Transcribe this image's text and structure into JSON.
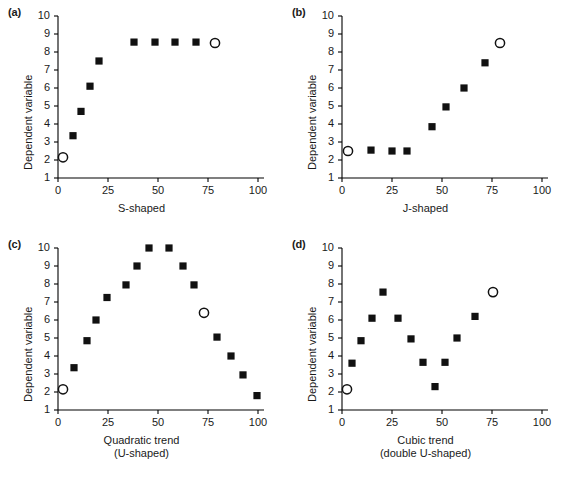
{
  "figure": {
    "caption_partial": "",
    "marker_filled": "filled-square",
    "marker_open": "open-circle",
    "axis_color": "#000000",
    "marker_color": "#111111"
  },
  "common": {
    "ylabel": "Dependent variable",
    "y_ticks": [
      "1",
      "2",
      "3",
      "4",
      "5",
      "6",
      "7",
      "8",
      "9",
      "10"
    ],
    "x_ticks": [
      "0",
      "25",
      "50",
      "75",
      "100"
    ],
    "ylim": [
      1,
      10
    ],
    "xlim": [
      0,
      100
    ]
  },
  "chart_data": [
    {
      "type": "scatter",
      "panel": "(a)",
      "title": "",
      "xlabel": "S-shaped",
      "xlabel_line2": "",
      "ylabel": "Dependent variable",
      "xlim": [
        0,
        100
      ],
      "ylim": [
        1,
        10
      ],
      "grid": false,
      "legend": "none",
      "series": [
        {
          "name": "data",
          "marker": "filled-square",
          "points": [
            {
              "x": 7.5,
              "y": 3.35
            },
            {
              "x": 11.5,
              "y": 4.7
            },
            {
              "x": 16.0,
              "y": 6.1
            },
            {
              "x": 20.5,
              "y": 7.5
            },
            {
              "x": 38.0,
              "y": 8.55
            },
            {
              "x": 48.5,
              "y": 8.55
            },
            {
              "x": 58.5,
              "y": 8.55
            },
            {
              "x": 69.0,
              "y": 8.55
            }
          ]
        },
        {
          "name": "highlighted",
          "marker": "open-circle",
          "points": [
            {
              "x": 2.5,
              "y": 2.15
            },
            {
              "x": 78.5,
              "y": 8.5
            }
          ]
        }
      ]
    },
    {
      "type": "scatter",
      "panel": "(b)",
      "title": "",
      "xlabel": "J-shaped",
      "xlabel_line2": "",
      "ylabel": "Dependent variable",
      "xlim": [
        0,
        100
      ],
      "ylim": [
        1,
        10
      ],
      "grid": false,
      "legend": "none",
      "series": [
        {
          "name": "data",
          "marker": "filled-square",
          "points": [
            {
              "x": 14.5,
              "y": 2.55
            },
            {
              "x": 25.0,
              "y": 2.5
            },
            {
              "x": 32.5,
              "y": 2.5
            },
            {
              "x": 45.0,
              "y": 3.85
            },
            {
              "x": 52.0,
              "y": 4.95
            },
            {
              "x": 61.0,
              "y": 6.0
            },
            {
              "x": 71.5,
              "y": 7.4
            }
          ]
        },
        {
          "name": "highlighted",
          "marker": "open-circle",
          "points": [
            {
              "x": 3.0,
              "y": 2.5
            },
            {
              "x": 79.0,
              "y": 8.5
            }
          ]
        }
      ]
    },
    {
      "type": "scatter",
      "panel": "(c)",
      "title": "",
      "xlabel": "Quadratic trend",
      "xlabel_line2": "(U-shaped)",
      "ylabel": "Dependent variable",
      "xlim": [
        0,
        100
      ],
      "ylim": [
        1,
        10
      ],
      "grid": false,
      "legend": "none",
      "series": [
        {
          "name": "data",
          "marker": "filled-square",
          "points": [
            {
              "x": 8.0,
              "y": 3.35
            },
            {
              "x": 14.5,
              "y": 4.85
            },
            {
              "x": 19.0,
              "y": 6.0
            },
            {
              "x": 24.5,
              "y": 7.25
            },
            {
              "x": 34.0,
              "y": 7.95
            },
            {
              "x": 39.5,
              "y": 9.0
            },
            {
              "x": 45.5,
              "y": 10.0
            },
            {
              "x": 55.5,
              "y": 10.0
            },
            {
              "x": 62.5,
              "y": 9.0
            },
            {
              "x": 68.0,
              "y": 7.95
            },
            {
              "x": 79.5,
              "y": 5.05
            },
            {
              "x": 86.5,
              "y": 4.0
            },
            {
              "x": 92.5,
              "y": 2.95
            },
            {
              "x": 99.5,
              "y": 1.8
            }
          ]
        },
        {
          "name": "highlighted",
          "marker": "open-circle",
          "points": [
            {
              "x": 2.5,
              "y": 2.15
            },
            {
              "x": 73.0,
              "y": 6.4
            }
          ]
        }
      ]
    },
    {
      "type": "scatter",
      "panel": "(d)",
      "title": "",
      "xlabel": "Cubic trend",
      "xlabel_line2": "(double U-shaped)",
      "ylabel": "Dependent variable",
      "xlim": [
        0,
        100
      ],
      "ylim": [
        1,
        10
      ],
      "grid": false,
      "legend": "none",
      "series": [
        {
          "name": "data",
          "marker": "filled-square",
          "points": [
            {
              "x": 5.0,
              "y": 3.6
            },
            {
              "x": 9.5,
              "y": 4.85
            },
            {
              "x": 15.0,
              "y": 6.1
            },
            {
              "x": 20.5,
              "y": 7.55
            },
            {
              "x": 28.0,
              "y": 6.1
            },
            {
              "x": 34.5,
              "y": 4.95
            },
            {
              "x": 40.5,
              "y": 3.65
            },
            {
              "x": 46.5,
              "y": 2.3
            },
            {
              "x": 51.5,
              "y": 3.65
            },
            {
              "x": 57.5,
              "y": 5.0
            },
            {
              "x": 66.5,
              "y": 6.2
            }
          ]
        },
        {
          "name": "highlighted",
          "marker": "open-circle",
          "points": [
            {
              "x": 2.5,
              "y": 2.15
            },
            {
              "x": 75.5,
              "y": 7.55
            }
          ]
        }
      ]
    }
  ]
}
